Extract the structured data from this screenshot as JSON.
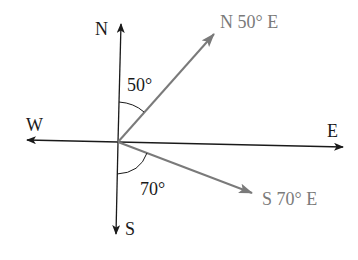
{
  "diagram": {
    "type": "compass-bearing",
    "colors": {
      "axes": "#1a1a1a",
      "bearings": "#7a7a7a"
    },
    "directions": {
      "north": "N",
      "south": "S",
      "east": "E",
      "west": "W"
    },
    "bearings": [
      {
        "label": "N 50° E",
        "angle_label": "50°",
        "from": "N",
        "angle": 50,
        "toward": "E"
      },
      {
        "label": "S 70° E",
        "angle_label": "70°",
        "from": "S",
        "angle": 70,
        "toward": "E"
      }
    ]
  }
}
